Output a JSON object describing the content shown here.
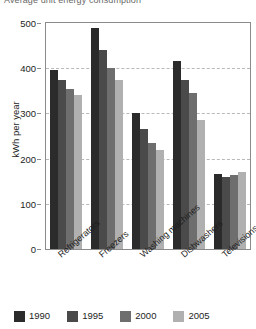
{
  "chart_data": {
    "type": "bar",
    "title": "Average unit energy consumption",
    "xlabel": "",
    "ylabel": "kWh per year",
    "ylim": [
      0,
      500
    ],
    "yticks": [
      0,
      100,
      200,
      300,
      400,
      500
    ],
    "grid": true,
    "legend_position": "bottom",
    "categories": [
      "Refrigerators",
      "Freezers",
      "Washing machines",
      "Dishwashers",
      "Televisions"
    ],
    "series": [
      {
        "name": "1990",
        "color": "#2b2b2b",
        "values": [
          395,
          490,
          300,
          415,
          165
        ]
      },
      {
        "name": "1995",
        "color": "#4a4a4a",
        "values": [
          375,
          440,
          265,
          375,
          160
        ]
      },
      {
        "name": "2000",
        "color": "#6e6e6e",
        "values": [
          355,
          400,
          235,
          345,
          163
        ]
      },
      {
        "name": "2005",
        "color": "#b0b0b0",
        "values": [
          340,
          375,
          220,
          285,
          170
        ]
      }
    ]
  },
  "axis": {
    "tick_labels": [
      "500",
      "400",
      "300",
      "200",
      "100",
      "0"
    ],
    "y_label": "kWh per year"
  },
  "legend": {
    "items": [
      {
        "label": "1990",
        "color": "#2b2b2b"
      },
      {
        "label": "1995",
        "color": "#4a4a4a"
      },
      {
        "label": "2000",
        "color": "#6e6e6e"
      },
      {
        "label": "2005",
        "color": "#b0b0b0"
      }
    ]
  }
}
